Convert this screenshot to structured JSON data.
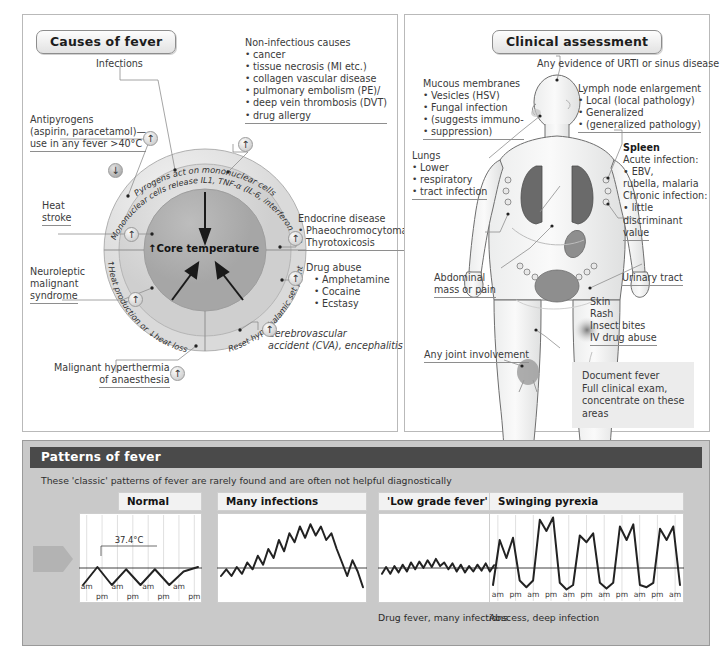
{
  "panels": {
    "causes": {
      "title": "Causes of fever",
      "circle": {
        "ring_outer": "Pyrogens act on mononuclear cells",
        "ring_inner": "Mononuclear cells release IL1, TNF-α (IL-6, interferon γ)",
        "segment_left": "↑Heat production or ↓heat loss",
        "segment_right": "Reset hypothalamic set point",
        "core": "↑Core temperature"
      },
      "labels": {
        "infections": "Infections",
        "antipyrogens": [
          "Antipyrogens",
          "(aspirin, paracetamol)—",
          "use in any fever >40°C"
        ],
        "noninfectious_title": "Non-infectious causes",
        "noninfectious_items": [
          "cancer",
          "tissue necrosis (MI etc.)",
          "collagen vascular disease",
          "pulmonary embolism (PE)/",
          "deep vein thrombosis (DVT)",
          "drug allergy"
        ],
        "endocrine_title": "Endocrine disease",
        "endocrine_items": [
          "Phaeochromocytoma",
          "Thyrotoxicosis"
        ],
        "drug_abuse_title": "Drug abuse",
        "drug_abuse_items": [
          "Amphetamine",
          "Cocaine",
          "Ecstasy"
        ],
        "cerebrovascular": [
          "Cerebrovascular",
          "accident (CVA), encephalitis"
        ],
        "heat_stroke": [
          "Heat",
          "stroke"
        ],
        "neuroleptic": [
          "Neuroleptic",
          "malignant",
          "syndrome"
        ],
        "malignant_hyperthermia": [
          "Malignant hyperthermia",
          "of anaesthesia"
        ]
      }
    },
    "clinical": {
      "title": "Clinical assessment",
      "urti": "Any evidence of URTI or sinus disease",
      "mucous_title": "Mucous membranes",
      "mucous_items": [
        "Vesicles (HSV)",
        "Fungal infection",
        "(suggests immuno-",
        "suppression)"
      ],
      "lymph_title": "Lymph node enlargement",
      "lymph_items": [
        "Local (local pathology)",
        "Generalized",
        "(generalized pathology)"
      ],
      "spleen_title": "Spleen",
      "spleen_lines": [
        "Acute infection:",
        "• EBV,",
        "   rubella, malaria",
        "Chronic infection:",
        "• little",
        "   discriminant",
        "   value"
      ],
      "lungs_title": "Lungs",
      "lungs_items": [
        "Lower",
        "respiratory",
        "tract infection"
      ],
      "abdominal": [
        "Abdominal",
        "mass or pain"
      ],
      "urinary": "Urinary tract",
      "joint": "Any joint involvement",
      "skin_lines": [
        "Skin",
        "Rash",
        "Insect bites",
        "IV drug abuse"
      ],
      "note_lines": [
        "Document fever",
        "Full clinical exam,",
        "concentrate on these",
        "areas"
      ]
    },
    "patterns": {
      "header": "Patterns of fever",
      "note": "These 'classic' patterns of fever are rarely found and are often not helpful diagnostically",
      "baseline_label": "37°C",
      "peak_label": "37.4°C",
      "charts": [
        {
          "title": "Normal",
          "caption": "",
          "ticks": [
            "am",
            "pm",
            "am",
            "pm",
            "am",
            "pm",
            "am",
            "pm"
          ]
        },
        {
          "title": "Many infections",
          "caption": "",
          "ticks": []
        },
        {
          "title": "'Low grade fever'",
          "caption": "Drug fever, many infections",
          "ticks": []
        },
        {
          "title": "Swinging pyrexia",
          "caption": "Abscess, deep infection",
          "ticks": [
            "am",
            "pm",
            "am",
            "pm",
            "am",
            "pm",
            "am",
            "pm",
            "am",
            "pm",
            "am"
          ]
        }
      ]
    }
  },
  "chart_data": [
    {
      "type": "line",
      "title": "Normal",
      "ylabel": "Temperature (°C)",
      "baseline": 37.0,
      "peak": 37.4,
      "ylim": [
        36.6,
        38.6
      ],
      "x": [
        0,
        1,
        2,
        3,
        4,
        5,
        6,
        7,
        8
      ],
      "values": [
        37.0,
        37.4,
        37.0,
        37.35,
        37.0,
        37.35,
        37.0,
        37.3,
        37.4
      ],
      "xticks": [
        "am",
        "pm",
        "am",
        "pm",
        "am",
        "pm",
        "am",
        "pm"
      ],
      "grid": true
    },
    {
      "type": "line",
      "title": "Many infections",
      "baseline": 37.0,
      "ylim": [
        36.6,
        38.6
      ],
      "values": [
        37.2,
        37.35,
        37.2,
        37.4,
        37.25,
        37.5,
        37.35,
        37.65,
        37.45,
        37.8,
        37.6,
        38.0,
        37.75,
        38.15,
        37.95,
        38.3,
        38.05,
        38.35,
        38.1,
        38.3,
        38.0,
        38.15,
        37.8,
        37.5,
        37.2,
        37.55,
        37.3,
        36.95
      ],
      "grid": false
    },
    {
      "type": "line",
      "title": "'Low grade fever'",
      "caption": "Drug fever, many infections",
      "baseline": 37.0,
      "ylim": [
        36.6,
        38.6
      ],
      "values": [
        37.25,
        37.4,
        37.25,
        37.42,
        37.28,
        37.45,
        37.3,
        37.5,
        37.35,
        37.52,
        37.38,
        37.55,
        37.4,
        37.58,
        37.42,
        37.5,
        37.35,
        37.48,
        37.3,
        37.45,
        37.28,
        37.42,
        37.3,
        37.45,
        37.32,
        37.48,
        37.3,
        37.44
      ],
      "grid": false
    },
    {
      "type": "line",
      "title": "Swinging pyrexia",
      "caption": "Abscess, deep infection",
      "baseline": 37.0,
      "ylim": [
        36.6,
        38.6
      ],
      "values": [
        37.0,
        38.0,
        37.6,
        38.05,
        37.1,
        36.95,
        37.1,
        38.45,
        38.2,
        38.5,
        37.05,
        36.9,
        37.0,
        38.1,
        37.95,
        38.15,
        37.05,
        36.92,
        37.05,
        38.3,
        38.0,
        38.35,
        37.0,
        36.95,
        37.05,
        38.25,
        38.0,
        38.3,
        37.0
      ],
      "xticks": [
        "am",
        "pm",
        "am",
        "pm",
        "am",
        "pm",
        "am",
        "pm",
        "am",
        "pm",
        "am"
      ],
      "grid": true
    }
  ]
}
